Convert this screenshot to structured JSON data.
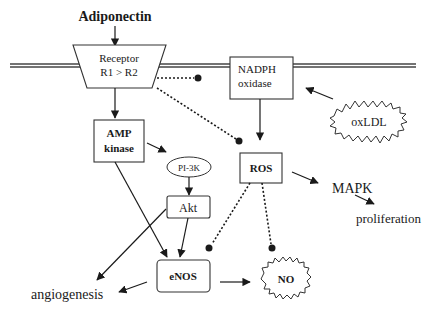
{
  "diagram": {
    "title": "Adiponectin",
    "nodes": {
      "receptor": {
        "line1": "Receptor",
        "line2": "R1 > R2"
      },
      "nadph": {
        "line1": "NADPH",
        "line2": "oxidase"
      },
      "oxldl": {
        "label": "oxLDL"
      },
      "amp": {
        "line1": "AMP",
        "line2": "kinase"
      },
      "pi3k": {
        "label": "PI-3K"
      },
      "ros": {
        "label": "ROS"
      },
      "mapk": {
        "label": "MAPK"
      },
      "proliferation": {
        "label": "proliferation"
      },
      "akt": {
        "label": "Akt"
      },
      "enos": {
        "label": "eNOS"
      },
      "no": {
        "label": "NO"
      },
      "angiogenesis": {
        "label": "angiogenesis"
      }
    },
    "edges": [
      {
        "from": "Adiponectin",
        "to": "receptor",
        "type": "activate"
      },
      {
        "from": "receptor",
        "to": "amp",
        "type": "activate"
      },
      {
        "from": "receptor",
        "to": "nadph",
        "type": "inhibit"
      },
      {
        "from": "receptor",
        "to": "ros",
        "type": "inhibit"
      },
      {
        "from": "oxldl",
        "to": "nadph",
        "type": "activate"
      },
      {
        "from": "nadph",
        "to": "ros",
        "type": "activate"
      },
      {
        "from": "amp",
        "to": "pi3k",
        "type": "activate"
      },
      {
        "from": "amp",
        "to": "enos",
        "type": "activate"
      },
      {
        "from": "pi3k",
        "to": "akt",
        "type": "activate"
      },
      {
        "from": "akt",
        "to": "enos",
        "type": "activate"
      },
      {
        "from": "akt",
        "to": "angiogenesis",
        "type": "activate"
      },
      {
        "from": "enos",
        "to": "angiogenesis",
        "type": "activate"
      },
      {
        "from": "enos",
        "to": "no",
        "type": "activate"
      },
      {
        "from": "ros",
        "to": "mapk",
        "type": "activate"
      },
      {
        "from": "mapk",
        "to": "proliferation",
        "type": "activate"
      },
      {
        "from": "ros",
        "to": "enos",
        "type": "inhibit"
      },
      {
        "from": "ros",
        "to": "no",
        "type": "inhibit"
      }
    ]
  }
}
